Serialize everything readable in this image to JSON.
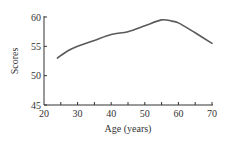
{
  "chart_data": {
    "type": "line",
    "title": "",
    "xlabel": "Age (years)",
    "ylabel": "Scores",
    "xlim": [
      20,
      70
    ],
    "ylim": [
      45,
      60
    ],
    "x_ticks": [
      20,
      30,
      40,
      50,
      60,
      70
    ],
    "x_minor_ticks": [
      25,
      35,
      45,
      55,
      65
    ],
    "y_ticks": [
      45,
      50,
      55,
      60
    ],
    "grid": false,
    "legend": null,
    "series": [
      {
        "name": "Scores",
        "x": [
          24,
          27,
          30,
          35,
          40,
          45,
          50,
          55,
          58,
          60,
          65,
          70
        ],
        "values": [
          53,
          54.2,
          55,
          56,
          57,
          57.5,
          58.5,
          59.5,
          59.3,
          59,
          57.3,
          55.5
        ]
      }
    ],
    "colors": {
      "line": "#5a5a5a",
      "axis": "#333333"
    }
  }
}
